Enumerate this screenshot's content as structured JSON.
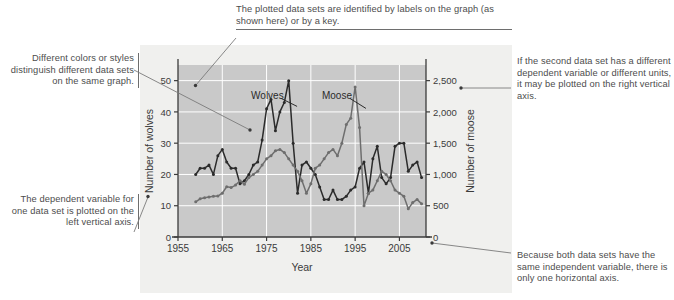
{
  "callouts": {
    "top": "The plotted data sets are identified by labels on the graph (as shown here) or by a key.",
    "left_top": "Different colors or styles distinguish different data sets on the same graph.",
    "left_bottom": "The dependent variable for one data set is plotted on the left vertical axis.",
    "right_top": "If the second data set has a different dependent variable or different units, it may be plotted on the right vertical axis.",
    "right_bottom": "Because both data sets have the same independent variable, there is only one horizontal axis."
  },
  "colors": {
    "plot_background": "#c9c9c9",
    "figure_background": "#f0f0ee",
    "gridline": "#ffffff",
    "axis": "#3b3b3b",
    "wolves_series": "#2b2b2b",
    "moose_series": "#6e6e6e",
    "callout_text": "#4d4d4d",
    "leader_line": "#7a7a7a"
  },
  "chart_data": {
    "type": "line",
    "title": "",
    "xlabel": "Year",
    "ylabel": "Number of wolves",
    "y2label": "Number of moose",
    "xlim": [
      1955,
      2011
    ],
    "ylim": [
      0,
      55
    ],
    "y2lim": [
      0,
      2750
    ],
    "grid": true,
    "legend": "in-plot data labels",
    "xticks": [
      1955,
      1965,
      1975,
      1985,
      1995,
      2005
    ],
    "xticklabels": [
      "1955",
      "1965",
      "1975",
      "1985",
      "1995",
      "2005"
    ],
    "yticks": [
      0,
      10,
      20,
      30,
      40,
      50
    ],
    "yticklabels": [
      "0",
      "10",
      "20",
      "30",
      "40",
      "50"
    ],
    "y2ticks": [
      0,
      500,
      1000,
      1500,
      2000,
      2500
    ],
    "y2ticklabels": [
      "0",
      "500",
      "1,000",
      "1,500",
      "2,000",
      "2,500"
    ],
    "annotations": [
      {
        "text": "Wolves",
        "x": 1971.5,
        "y": 44
      },
      {
        "text": "Moose",
        "x": 1987.5,
        "y": 44
      }
    ],
    "x": [
      1959,
      1960,
      1961,
      1962,
      1963,
      1964,
      1965,
      1966,
      1967,
      1968,
      1969,
      1970,
      1971,
      1972,
      1973,
      1974,
      1975,
      1976,
      1977,
      1978,
      1979,
      1980,
      1981,
      1982,
      1983,
      1984,
      1985,
      1986,
      1987,
      1988,
      1989,
      1990,
      1991,
      1992,
      1993,
      1994,
      1995,
      1996,
      1997,
      1998,
      1999,
      2000,
      2001,
      2002,
      2003,
      2004,
      2005,
      2006,
      2007,
      2008,
      2009,
      2010
    ],
    "series": [
      {
        "name": "Wolves",
        "axis": "left",
        "units": "number of wolves",
        "values": [
          20,
          22,
          22,
          23,
          20,
          26,
          28,
          24,
          22,
          22,
          17,
          18,
          20,
          23,
          24,
          31,
          41,
          44,
          34,
          40,
          43,
          50,
          30,
          14,
          23,
          24,
          22,
          20,
          16,
          12,
          12,
          15,
          12,
          12,
          13,
          15,
          16,
          22,
          24,
          14,
          25,
          29,
          19,
          17,
          19,
          29,
          30,
          30,
          21,
          23,
          24,
          19
        ]
      },
      {
        "name": "Moose",
        "axis": "right",
        "units": "number of moose",
        "values": [
          563,
          610,
          628,
          639,
          650,
          655,
          700,
          805,
          790,
          830,
          900,
          845,
          950,
          1000,
          1050,
          1150,
          1250,
          1300,
          1380,
          1400,
          1350,
          1250,
          1150,
          1050,
          900,
          700,
          850,
          1100,
          1150,
          1250,
          1350,
          1400,
          1300,
          1500,
          1800,
          1900,
          2400,
          1750,
          500,
          700,
          750,
          900,
          1050,
          1000,
          900,
          750,
          700,
          650,
          450,
          550,
          600,
          530
        ]
      }
    ]
  }
}
